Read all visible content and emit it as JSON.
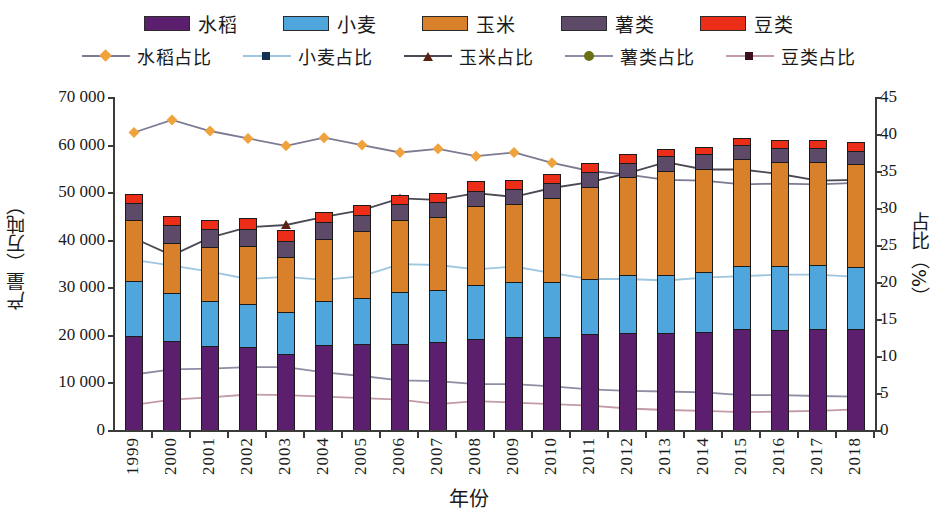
{
  "axes": {
    "y_left_title": "产量（万吨）",
    "y_right_title": "占比（%）",
    "x_title": "年份",
    "y_left_ticks": [
      "0",
      "10 000",
      "20 000",
      "30 000",
      "40 000",
      "50 000",
      "60 000",
      "70 000"
    ],
    "y_right_ticks": [
      "0",
      "5",
      "10",
      "15",
      "20",
      "25",
      "30",
      "35",
      "40",
      "45"
    ]
  },
  "legend": {
    "bars": [
      {
        "label": "水稻",
        "color": "#5b1f6e"
      },
      {
        "label": "小麦",
        "color": "#4ea6dc"
      },
      {
        "label": "玉米",
        "color": "#d9812a"
      },
      {
        "label": "薯类",
        "color": "#5d4a69"
      },
      {
        "label": "豆类",
        "color": "#ec2d17"
      }
    ],
    "lines": [
      {
        "label": "水稻占比",
        "color": "#7c7b93",
        "marker": "diamond",
        "marker_color": "#f0a martin"
      },
      {
        "label": "小麦占比",
        "color": "#9dc6e0",
        "marker": "x",
        "marker_color": "#1b3a5c"
      },
      {
        "label": "玉米占比",
        "color": "#4a4a55",
        "marker": "triangle",
        "marker_color": "#5a2012"
      },
      {
        "label": "薯类占比",
        "color": "#8d8da4",
        "marker": "circle",
        "marker_color": "#6b7016"
      },
      {
        "label": "豆类占比",
        "color": "#c39aa8",
        "marker": "x",
        "marker_color": "#3a1020"
      }
    ]
  },
  "chart_data": {
    "type": "bar",
    "title": "",
    "xlabel": "年份",
    "ylabel": "产量（万吨）",
    "y2label": "占比（%）",
    "ylim": [
      0,
      70000
    ],
    "y2lim": [
      0,
      45
    ],
    "grid": false,
    "legend_position": "top",
    "stacked": true,
    "categories": [
      "1999",
      "2000",
      "2001",
      "2002",
      "2003",
      "2004",
      "2005",
      "2006",
      "2007",
      "2008",
      "2009",
      "2010",
      "2011",
      "2012",
      "2013",
      "2014",
      "2015",
      "2016",
      "2017",
      "2018"
    ],
    "series": [
      {
        "name": "水稻",
        "axis": "left",
        "kind": "bar",
        "values": [
          19849,
          18791,
          17758,
          17454,
          16066,
          17909,
          18059,
          18172,
          18603,
          19190,
          19510,
          19576,
          20100,
          20429,
          20361,
          20651,
          21214,
          21109,
          21268,
          21213
        ]
      },
      {
        "name": "小麦",
        "axis": "left",
        "kind": "bar",
        "values": [
          11388,
          9964,
          9387,
          9029,
          8649,
          9195,
          9745,
          10847,
          10930,
          11246,
          11512,
          11518,
          11740,
          12102,
          12193,
          12621,
          13264,
          13327,
          13433,
          13144
        ]
      },
      {
        "name": "玉米",
        "axis": "left",
        "kind": "bar",
        "values": [
          12809,
          10600,
          11409,
          12131,
          11583,
          13029,
          13937,
          15160,
          15230,
          16591,
          16397,
          17725,
          19278,
          20561,
          21849,
          21565,
          22463,
          21955,
          21589,
          21473
        ]
      },
      {
        "name": "薯类",
        "axis": "left",
        "kind": "bar",
        "values": [
          3710,
          3678,
          3647,
          3754,
          3537,
          3556,
          3447,
          3240,
          3260,
          3220,
          3217,
          3206,
          3158,
          3142,
          3118,
          3113,
          3007,
          2957,
          2930,
          2865
        ]
      },
      {
        "name": "豆类",
        "axis": "left",
        "kind": "bar",
        "values": [
          1947,
          2010,
          2053,
          2241,
          2127,
          2232,
          2158,
          1961,
          1720,
          2043,
          1931,
          1896,
          1908,
          1713,
          1596,
          1565,
          1510,
          1596,
          1692,
          1784
        ]
      },
      {
        "name": "水稻占比",
        "axis": "right",
        "kind": "line",
        "values": [
          40.2,
          41.9,
          40.4,
          39.4,
          38.4,
          39.5,
          38.5,
          37.5,
          38.0,
          37.0,
          37.5,
          36.1,
          35.0,
          34.5,
          33.8,
          33.7,
          33.2,
          33.3,
          33.2,
          33.4
        ]
      },
      {
        "name": "小麦占比",
        "axis": "right",
        "kind": "line",
        "values": [
          23.0,
          22.2,
          21.4,
          20.4,
          20.7,
          20.3,
          20.8,
          22.4,
          22.3,
          21.7,
          22.1,
          21.2,
          20.4,
          20.4,
          20.2,
          20.6,
          20.8,
          21.0,
          21.0,
          20.7
        ]
      },
      {
        "name": "玉米占比",
        "axis": "right",
        "kind": "line",
        "values": [
          25.9,
          23.6,
          26.0,
          27.4,
          27.7,
          28.8,
          29.7,
          31.3,
          31.1,
          32.0,
          31.5,
          32.7,
          33.5,
          34.7,
          36.2,
          35.2,
          35.2,
          34.6,
          33.7,
          33.8
        ]
      },
      {
        "name": "薯类占比",
        "axis": "right",
        "kind": "line",
        "values": [
          7.5,
          8.2,
          8.3,
          8.5,
          8.5,
          7.8,
          7.3,
          6.7,
          6.6,
          6.2,
          6.2,
          5.9,
          5.5,
          5.3,
          5.2,
          5.1,
          4.7,
          4.7,
          4.6,
          4.5
        ]
      },
      {
        "name": "豆类占比",
        "axis": "right",
        "kind": "line",
        "values": [
          3.4,
          4.1,
          4.4,
          4.8,
          4.7,
          4.5,
          4.3,
          4.1,
          3.5,
          3.9,
          3.7,
          3.5,
          3.3,
          2.9,
          2.7,
          2.6,
          2.4,
          2.5,
          2.6,
          2.8
        ]
      }
    ]
  }
}
